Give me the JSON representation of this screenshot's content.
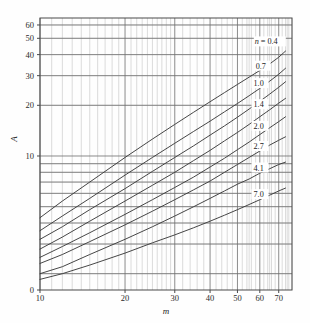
{
  "chart_data": {
    "type": "line",
    "title": "",
    "xlabel": "m",
    "ylabel": "A",
    "xscale": "log",
    "yscale": "log",
    "xlim": [
      10,
      78
    ],
    "ylim": [
      1.6,
      66
    ],
    "grid": true,
    "grid_style": "log-log major and minor",
    "legend_position": "inline-on-curve",
    "legend_title": "n =",
    "xticks": [
      10,
      20,
      30,
      40,
      50,
      60,
      70
    ],
    "xtick_labels": [
      "10",
      "20",
      "30",
      "40",
      "50",
      "60",
      "70"
    ],
    "yticks": [
      0,
      10,
      20,
      30,
      40,
      50,
      60
    ],
    "ytick_labels": [
      "0",
      "10",
      "20",
      "30",
      "40",
      "50",
      "60"
    ],
    "series": [
      {
        "name": "0.4",
        "label": "n = 0.4",
        "x": [
          10,
          12,
          15,
          20,
          25,
          30,
          35,
          40,
          45,
          50,
          55,
          60,
          65,
          70,
          74
        ],
        "y": [
          4.3,
          5.4,
          7.0,
          9.8,
          12.6,
          15.4,
          18.2,
          21.0,
          23.8,
          26.6,
          29.4,
          32.2,
          35.2,
          38.6,
          42.0
        ]
      },
      {
        "name": "0.7",
        "label": "0.7",
        "x": [
          10,
          12,
          15,
          20,
          25,
          30,
          35,
          40,
          45,
          50,
          55,
          60,
          65,
          70,
          74
        ],
        "y": [
          3.6,
          4.4,
          5.6,
          7.7,
          9.8,
          11.9,
          14.0,
          16.1,
          18.3,
          20.5,
          22.8,
          25.2,
          27.8,
          30.6,
          33.2
        ]
      },
      {
        "name": "1.0",
        "label": "1.0",
        "x": [
          10,
          12,
          15,
          20,
          25,
          30,
          35,
          40,
          45,
          50,
          55,
          60,
          65,
          70,
          74
        ],
        "y": [
          3.2,
          3.8,
          4.8,
          6.4,
          8.1,
          9.8,
          11.5,
          13.3,
          15.1,
          17.0,
          19.0,
          21.1,
          23.3,
          25.6,
          27.6
        ]
      },
      {
        "name": "1.4",
        "label": "1.4",
        "x": [
          10,
          12,
          15,
          20,
          25,
          30,
          35,
          40,
          45,
          50,
          55,
          60,
          65,
          70,
          74
        ],
        "y": [
          2.8,
          3.3,
          4.1,
          5.4,
          6.7,
          8.0,
          9.4,
          10.8,
          12.3,
          13.8,
          15.4,
          17.1,
          18.8,
          20.6,
          22.0
        ]
      },
      {
        "name": "2.0",
        "label": "2.0",
        "x": [
          10,
          12,
          15,
          20,
          25,
          30,
          35,
          40,
          45,
          50,
          55,
          60,
          65,
          70,
          74
        ],
        "y": [
          2.5,
          2.9,
          3.5,
          4.5,
          5.5,
          6.5,
          7.5,
          8.6,
          9.7,
          10.9,
          12.1,
          13.4,
          14.7,
          16.0,
          17.1
        ]
      },
      {
        "name": "2.7",
        "label": "2.7",
        "x": [
          10,
          12,
          15,
          20,
          25,
          30,
          35,
          40,
          45,
          50,
          55,
          60,
          65,
          70,
          74
        ],
        "y": [
          2.3,
          2.6,
          3.1,
          3.9,
          4.7,
          5.5,
          6.3,
          7.1,
          8.0,
          8.9,
          9.8,
          10.7,
          11.6,
          12.4,
          13.0
        ]
      },
      {
        "name": "4.1",
        "label": "4.1",
        "x": [
          10,
          12,
          15,
          20,
          25,
          30,
          35,
          40,
          45,
          50,
          55,
          60,
          65,
          70,
          74
        ],
        "y": [
          2.0,
          2.2,
          2.6,
          3.2,
          3.8,
          4.4,
          5.0,
          5.6,
          6.2,
          6.8,
          7.3,
          7.9,
          8.4,
          8.9,
          9.2
        ]
      },
      {
        "name": "7.0",
        "label": "7.0",
        "x": [
          10,
          12,
          15,
          20,
          25,
          30,
          35,
          40,
          45,
          50,
          55,
          60,
          65,
          70,
          74
        ],
        "y": [
          1.85,
          2.0,
          2.25,
          2.65,
          3.05,
          3.4,
          3.75,
          4.1,
          4.45,
          4.8,
          5.15,
          5.5,
          5.85,
          6.2,
          6.45
        ]
      }
    ],
    "annotations": [
      {
        "text": "n = 0.4",
        "x": 60,
        "y": 46
      },
      {
        "text": "0.7",
        "x": 58,
        "y": 33
      },
      {
        "text": "1.0",
        "x": 57,
        "y": 26
      },
      {
        "text": "1.4",
        "x": 57,
        "y": 19.5
      },
      {
        "text": "2.0",
        "x": 57,
        "y": 14.5
      },
      {
        "text": "2.7",
        "x": 57,
        "y": 11.0
      },
      {
        "text": "4.1",
        "x": 57,
        "y": 8.2
      },
      {
        "text": "7.0",
        "x": 57,
        "y": 5.7
      }
    ],
    "colors": {
      "curve": "#3c3c3c",
      "grid_major": "#6e6e6e",
      "grid_minor": "#b9b9b9",
      "frame": "#4a4a4a",
      "text": "#1d1d1d",
      "background": "#fefefe"
    }
  }
}
